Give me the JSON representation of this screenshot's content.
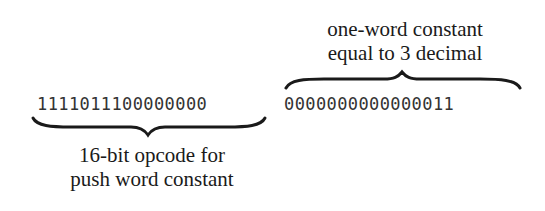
{
  "diagram": {
    "opcode_field": {
      "bits": "1111011100000000",
      "label_line1": "16-bit opcode for",
      "label_line2": "push word constant",
      "brace_position": "below"
    },
    "constant_field": {
      "bits": "0000000000000011",
      "label_line1": "one-word constant",
      "label_line2": "equal to 3 decimal",
      "brace_position": "above"
    },
    "colors": {
      "text": "#1a1a1a",
      "bits": "#333333",
      "brace": "#1a1a1a",
      "background": "#ffffff"
    }
  }
}
